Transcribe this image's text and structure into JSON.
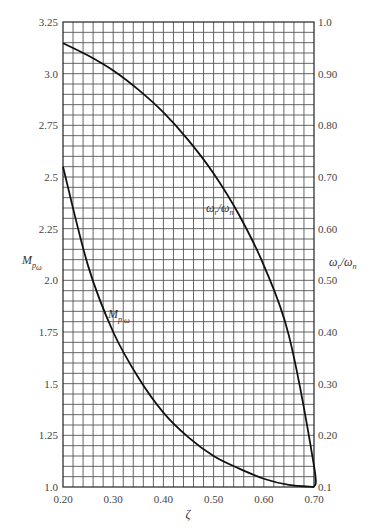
{
  "chart_data": {
    "type": "line",
    "title": "",
    "xlabel": "ζ",
    "ylabel_left": "M_pω",
    "ylabel_right": "ω_r/ω_n",
    "xlim": [
      0.2,
      0.7
    ],
    "ylim_left": [
      1.0,
      3.25
    ],
    "ylim_right": [
      0.1,
      1.0
    ],
    "grid": true,
    "grid_x_step": 0.02,
    "grid_y_step_left": 0.05,
    "x_ticks": [
      "0.20",
      "0.30",
      "0.40",
      "0.50",
      "0.60",
      "0.70"
    ],
    "left_ticks": [
      "1.0",
      "1.25",
      "1.5",
      "1.75",
      "2.0",
      "2.25",
      "2.5",
      "2.75",
      "3.0",
      "3.25"
    ],
    "right_ticks": [
      "0.1",
      "0.20",
      "0.30",
      "0.40",
      "0.50",
      "0.60",
      "0.70",
      "0.80",
      "0.90",
      "1.0"
    ],
    "x": [
      0.2,
      0.25,
      0.3,
      0.35,
      0.4,
      0.45,
      0.5,
      0.55,
      0.6,
      0.65,
      0.7
    ],
    "series": [
      {
        "name": "M_pω",
        "axis": "left",
        "values": [
          2.55,
          2.07,
          1.75,
          1.53,
          1.36,
          1.24,
          1.15,
          1.09,
          1.04,
          1.01,
          1.0
        ]
      },
      {
        "name": "ω_r/ω_n",
        "axis": "right",
        "values": [
          0.959,
          0.935,
          0.906,
          0.869,
          0.825,
          0.771,
          0.707,
          0.628,
          0.529,
          0.393,
          0.141
        ]
      }
    ],
    "annotations": [
      {
        "text": "M_pω",
        "near_series": "M_pω",
        "x": 0.3,
        "y_left": 2.05
      },
      {
        "text": "ω_r/ω_n",
        "near_series": "ω_r/ω_n",
        "x": 0.48,
        "y_right": 0.63
      }
    ]
  }
}
